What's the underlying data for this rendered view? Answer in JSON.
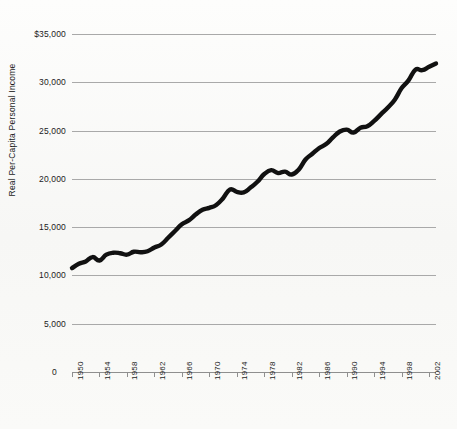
{
  "chart_data": {
    "type": "line",
    "title": "",
    "xlabel": "",
    "ylabel": "Real Per-Capita Personal Income",
    "ylim": [
      0,
      35000
    ],
    "xlim": [
      1950,
      2003
    ],
    "grid": true,
    "legend": false,
    "y_tick_labels": [
      "$35,000",
      "30,000",
      "25,000",
      "20,000",
      "15,000",
      "10,000",
      "5,000",
      "0"
    ],
    "y_ticks": [
      35000,
      30000,
      25000,
      20000,
      15000,
      10000,
      5000,
      0
    ],
    "x_tick_labels": [
      "1950",
      "1954",
      "1958",
      "1962",
      "1966",
      "1970",
      "1974",
      "1978",
      "1982",
      "1986",
      "1990",
      "1994",
      "1998",
      "2002"
    ],
    "x_ticks": [
      1950,
      1954,
      1958,
      1962,
      1966,
      1970,
      1974,
      1978,
      1982,
      1986,
      1990,
      1994,
      1998,
      2002
    ],
    "series": [
      {
        "name": "Real Per-Capita Personal Income",
        "color": "#111111",
        "x": [
          1950,
          1951,
          1952,
          1953,
          1954,
          1955,
          1956,
          1957,
          1958,
          1959,
          1960,
          1961,
          1962,
          1963,
          1964,
          1965,
          1966,
          1967,
          1968,
          1969,
          1970,
          1971,
          1972,
          1973,
          1974,
          1975,
          1976,
          1977,
          1978,
          1979,
          1980,
          1981,
          1982,
          1983,
          1984,
          1985,
          1986,
          1987,
          1988,
          1989,
          1990,
          1991,
          1992,
          1993,
          1994,
          1995,
          1996,
          1997,
          1998,
          1999,
          2000,
          2001,
          2002,
          2003
        ],
        "values": [
          10750,
          11200,
          11450,
          11900,
          11550,
          12150,
          12350,
          12300,
          12150,
          12450,
          12400,
          12500,
          12900,
          13200,
          13900,
          14600,
          15300,
          15700,
          16300,
          16800,
          17000,
          17300,
          18000,
          18900,
          18650,
          18600,
          19100,
          19700,
          20500,
          20900,
          20600,
          20750,
          20450,
          20950,
          22000,
          22600,
          23200,
          23600,
          24300,
          24900,
          25100,
          24800,
          25300,
          25450,
          26000,
          26700,
          27400,
          28200,
          29400,
          30200,
          31300,
          31250,
          31600,
          31950
        ]
      }
    ]
  },
  "axis": {
    "y_title": "Real Per-Capita Personal Income",
    "zero_label": "0"
  },
  "style": {
    "line_color": "#111111",
    "grid_color": "#a9a9a9",
    "background": "#fbfbfa",
    "text_color": "#1b1b1b"
  }
}
